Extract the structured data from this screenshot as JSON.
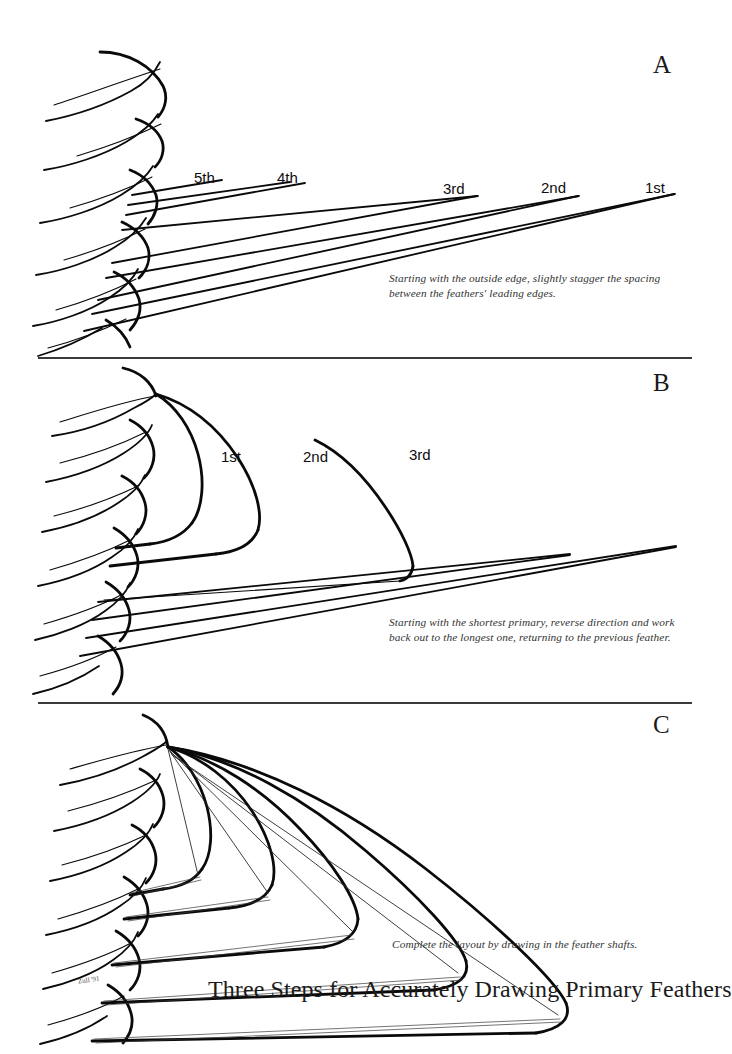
{
  "document": {
    "title": "Three Steps for Accurately Drawing Primary Feathers",
    "signature": "Zull '91",
    "background_color": "#ffffff",
    "ink_color": "#0a0a0a"
  },
  "panels": [
    {
      "letter": "A",
      "caption": "Starting with the outside edge, slightly stagger the spacing\nbetween the feathers' leading edges.",
      "labels": [
        {
          "text": "5th",
          "x": 194,
          "y": 170
        },
        {
          "text": "4th",
          "x": 277,
          "y": 170
        },
        {
          "text": "3rd",
          "x": 443,
          "y": 181
        },
        {
          "text": "2nd",
          "x": 541,
          "y": 180
        },
        {
          "text": "1st",
          "x": 645,
          "y": 180
        }
      ]
    },
    {
      "letter": "B",
      "caption": "Starting with the shortest primary, reverse direction and work\nback out to the longest one, returning to the previous feather.",
      "labels": [
        {
          "text": "1st",
          "x": 221,
          "y": 449
        },
        {
          "text": "2nd",
          "x": 303,
          "y": 449
        },
        {
          "text": "3rd",
          "x": 409,
          "y": 447
        }
      ]
    },
    {
      "letter": "C",
      "caption": "Complete the layout by drawing in the feather shafts.",
      "labels": []
    }
  ]
}
